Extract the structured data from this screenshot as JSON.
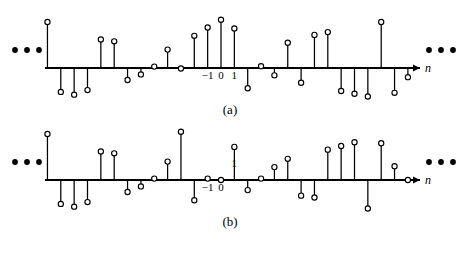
{
  "figure": {
    "background_color": "#ffffff",
    "ink_color": "#000000"
  },
  "chart_data": [
    {
      "type": "stem",
      "panel_id": "a",
      "caption": "(a)",
      "title": "",
      "xlabel": "n",
      "ylabel": "",
      "grid": false,
      "legend": null,
      "axis_label_italic": true,
      "left_ellipsis": "•••",
      "right_ellipsis": "•••",
      "tick_labels": [
        {
          "x": -1,
          "text": "-1",
          "position": "below"
        },
        {
          "x": 0,
          "text": "0",
          "position": "below"
        },
        {
          "x": 1,
          "text": "1",
          "position": "below"
        }
      ],
      "x": [
        -15,
        -14,
        -13,
        -12,
        -11,
        -10,
        -9,
        -8,
        -7,
        -6,
        -5,
        -4,
        -3,
        -2,
        -1,
        0,
        1,
        2,
        3,
        4,
        5,
        6,
        7,
        8,
        9,
        10,
        11,
        12,
        13,
        14
      ],
      "values": [
        -0.22,
        -0.55,
        1.0,
        -0.52,
        -0.58,
        -0.48,
        0.62,
        0.58,
        -0.26,
        -0.14,
        0.03,
        0.4,
        -0.01,
        0.7,
        0.88,
        1.05,
        0.86,
        -0.44,
        0.04,
        -0.16,
        0.55,
        -0.32,
        0.72,
        0.78,
        -0.5,
        -0.56,
        -0.62,
        1.0,
        -0.54,
        -0.2
      ],
      "xlim": [
        -15.5,
        14.5
      ],
      "ylim": [
        -0.75,
        1.15
      ]
    },
    {
      "type": "stem",
      "panel_id": "b",
      "caption": "(b)",
      "title": "",
      "xlabel": "n",
      "ylabel": "",
      "grid": false,
      "legend": null,
      "axis_label_italic": true,
      "left_ellipsis": "•••",
      "right_ellipsis": "•••",
      "tick_labels": [
        {
          "x": -1,
          "text": "-1",
          "position": "below"
        },
        {
          "x": 0,
          "text": "0",
          "position": "below"
        },
        {
          "x": 1,
          "text": "1",
          "position": "above"
        }
      ],
      "x": [
        -15,
        -14,
        -13,
        -12,
        -11,
        -10,
        -9,
        -8,
        -7,
        -6,
        -5,
        -4,
        -3,
        -2,
        -1,
        0,
        1,
        2,
        3,
        4,
        5,
        6,
        7,
        8,
        9,
        10,
        11,
        12,
        13,
        14
      ],
      "values": [
        -0.22,
        -0.55,
        1.0,
        -0.52,
        -0.58,
        -0.48,
        0.62,
        0.58,
        -0.26,
        -0.14,
        0.03,
        0.4,
        1.05,
        -0.44,
        0.03,
        0.0,
        0.72,
        -0.22,
        0.03,
        0.28,
        0.46,
        -0.34,
        -0.38,
        0.66,
        0.74,
        0.82,
        -0.62,
        0.8,
        0.3,
        0.0
      ],
      "xlim": [
        -15.5,
        14.5
      ],
      "ylim": [
        -0.75,
        1.15
      ]
    }
  ]
}
